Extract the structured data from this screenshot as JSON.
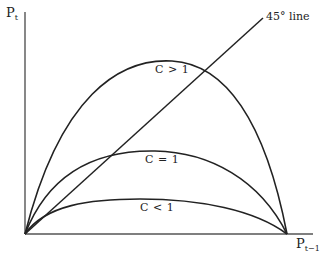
{
  "axes": {
    "y_label_main": "P",
    "y_label_sub": "t",
    "x_label_main": "P",
    "x_label_sub": "t−1"
  },
  "annotations": {
    "diagonal": "45° line",
    "curve_high": "C > 1",
    "curve_mid": "C = 1",
    "curve_low": "C < 1"
  },
  "colors": {
    "line": "#222222",
    "axis": "#555555",
    "background": "#ffffff"
  },
  "geometry": {
    "origin": [
      25,
      234
    ],
    "x_axis_end": [
      313,
      234
    ],
    "y_axis_top": [
      25,
      12
    ],
    "diagonal_end": [
      263,
      18
    ],
    "curves_end": [
      287,
      234
    ],
    "peak_c_gt_1": [
      172,
      61
    ],
    "peak_c_eq_1": [
      155,
      151
    ],
    "peak_c_lt_1": [
      140,
      199
    ]
  }
}
